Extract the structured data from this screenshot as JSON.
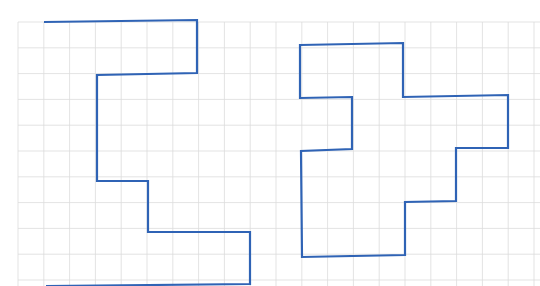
{
  "diagram": {
    "grid": {
      "origin_x": 18,
      "origin_y": 22,
      "cell": 25.8,
      "cols": 20,
      "rows": 11,
      "line_color": "#dcdcdc"
    },
    "shapes": [
      {
        "name": "left-shape",
        "stroke": "#2f63b5",
        "points": [
          [
            44,
            22
          ],
          [
            197,
            20
          ],
          [
            197,
            73
          ],
          [
            97,
            75
          ],
          [
            97,
            181
          ],
          [
            148,
            181
          ],
          [
            148,
            232
          ],
          [
            250,
            232
          ],
          [
            250,
            284
          ],
          [
            46,
            286
          ]
        ]
      },
      {
        "name": "right-shape",
        "stroke": "#2f63b5",
        "points": [
          [
            300,
            45
          ],
          [
            403,
            43
          ],
          [
            403,
            97
          ],
          [
            508,
            95
          ],
          [
            508,
            148
          ],
          [
            456,
            148
          ],
          [
            456,
            201
          ],
          [
            405,
            202
          ],
          [
            405,
            255
          ],
          [
            302,
            257
          ],
          [
            301,
            151
          ],
          [
            352,
            149
          ],
          [
            352,
            97
          ],
          [
            300,
            98
          ]
        ]
      }
    ]
  }
}
